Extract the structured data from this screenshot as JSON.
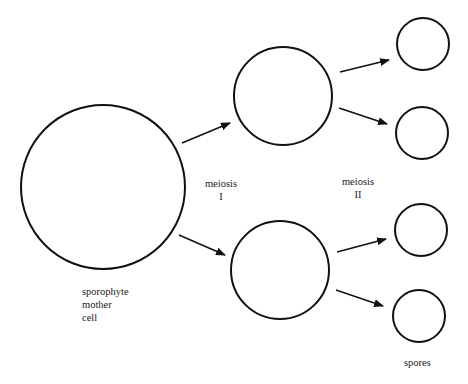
{
  "diagram": {
    "title": "",
    "labels": {
      "mother_cell": [
        "sporophyte",
        "mother",
        "cell"
      ],
      "meiosis1": [
        "meiosis",
        "I"
      ],
      "meiosis2": [
        "meiosis",
        "II"
      ],
      "spores": "spores"
    },
    "nodes": [
      {
        "id": "mother",
        "cx": 103,
        "cy": 187,
        "r": 82
      },
      {
        "id": "m1-top",
        "cx": 283,
        "cy": 96,
        "r": 49
      },
      {
        "id": "m1-bottom",
        "cx": 280,
        "cy": 270,
        "r": 49
      },
      {
        "id": "spore-1",
        "cx": 423,
        "cy": 44,
        "r": 26
      },
      {
        "id": "spore-2",
        "cx": 422,
        "cy": 133,
        "r": 26
      },
      {
        "id": "spore-3",
        "cx": 421,
        "cy": 230,
        "r": 26
      },
      {
        "id": "spore-4",
        "cx": 419,
        "cy": 316,
        "r": 26
      }
    ],
    "edges": [
      {
        "from": "mother",
        "to": "m1-top",
        "x1": 182,
        "y1": 143,
        "x2": 230,
        "y2": 123
      },
      {
        "from": "mother",
        "to": "m1-bottom",
        "x1": 179,
        "y1": 235,
        "x2": 225,
        "y2": 255
      },
      {
        "from": "m1-top",
        "to": "spore-1",
        "x1": 340,
        "y1": 72,
        "x2": 389,
        "y2": 60
      },
      {
        "from": "m1-top",
        "to": "spore-2",
        "x1": 339,
        "y1": 108,
        "x2": 387,
        "y2": 124
      },
      {
        "from": "m1-bottom",
        "to": "spore-3",
        "x1": 337,
        "y1": 252,
        "x2": 386,
        "y2": 239
      },
      {
        "from": "m1-bottom",
        "to": "spore-4",
        "x1": 336,
        "y1": 290,
        "x2": 383,
        "y2": 306
      }
    ],
    "stroke_color": "#111111"
  }
}
